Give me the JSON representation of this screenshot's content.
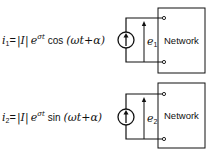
{
  "diagram": {
    "circuits": [
      {
        "id": "circuit-1",
        "equation": {
          "lhs": "i",
          "lhs_sub": "1",
          "eq": "=",
          "magnitude": "|I|",
          "exp_base": "e",
          "exp_power": "σt",
          "func": "cos",
          "argument": "(ωt+α)"
        },
        "source": "current-source",
        "voltage_label": "e",
        "voltage_sub": "1",
        "network_label": "Network"
      },
      {
        "id": "circuit-2",
        "equation": {
          "lhs": "i",
          "lhs_sub": "2",
          "eq": "=",
          "magnitude": "|I|",
          "exp_base": "e",
          "exp_power": "σt",
          "func": "sin",
          "argument": "(ωt+α)"
        },
        "source": "current-source",
        "voltage_label": "e",
        "voltage_sub": "2",
        "network_label": "Network"
      }
    ]
  }
}
